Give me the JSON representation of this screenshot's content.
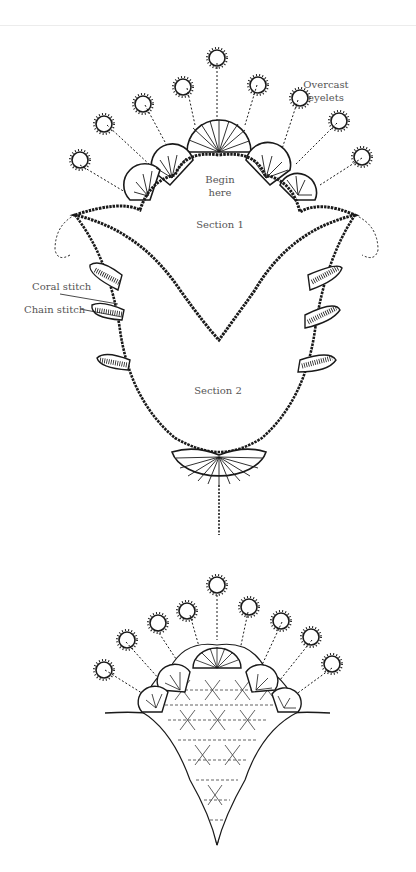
{
  "figure_1": {
    "labels": {
      "overcast_eyelets_line1": "Overcast",
      "overcast_eyelets_line2": "eyelets",
      "begin_here_line1": "Begin",
      "begin_here_line2": "here",
      "section_1": "Section 1",
      "section_2": "Section 2",
      "coral_stitch": "Coral stitch",
      "chain_stitch": "Chain stitch"
    }
  },
  "figure_2": {
    "labels": {}
  },
  "colors": {
    "ink": "#1a1a1a",
    "label_text": "#555555",
    "background": "#ffffff"
  }
}
